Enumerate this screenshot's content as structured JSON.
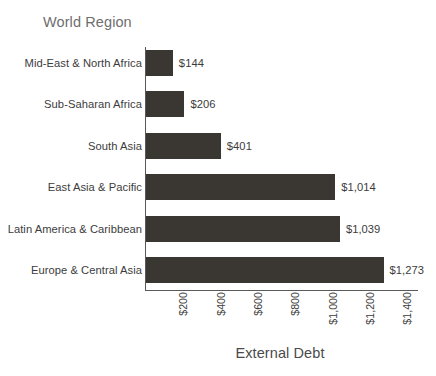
{
  "chart_data": {
    "type": "bar",
    "orientation": "horizontal",
    "title": "",
    "xlabel": "External Debt",
    "ylabel": "World Region",
    "categories": [
      "Mid-East & North Africa",
      "Sub-Saharan Africa",
      "South Asia",
      "East Asia & Pacific",
      "Latin America & Caribbean",
      "Europe & Central Asia"
    ],
    "values": [
      144,
      206,
      401,
      1014,
      1039,
      1273
    ],
    "value_labels": [
      "$144",
      "$206",
      "$401",
      "$1,014",
      "$1,039",
      "$1,273"
    ],
    "xlim": [
      0,
      1480
    ],
    "xticks": [
      200,
      400,
      600,
      800,
      1000,
      1200,
      1400
    ],
    "xtick_labels": [
      "$200",
      "$400",
      "$600",
      "$800",
      "$1,000",
      "$1,200",
      "$1,400"
    ],
    "grid": false,
    "legend": "none",
    "bar_color": "#3a3631",
    "text_color": "#3c3c3c",
    "axis_color": "#5a5a5a",
    "background": "#ffffff"
  },
  "labels": {
    "y_axis_title": "World Region",
    "x_axis_title": "External Debt"
  }
}
